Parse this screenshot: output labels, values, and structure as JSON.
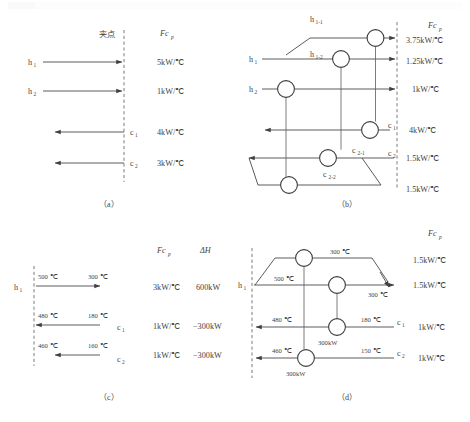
{
  "figure": {
    "captions": {
      "a": "（a）",
      "b": "（b）",
      "c": "（c）",
      "d": "（d）"
    },
    "headers": {
      "fcp": "Fc",
      "fcp_sub": "p",
      "dh": "ΔH",
      "pinch": "夹点"
    }
  },
  "panel_a": {
    "streams": [
      {
        "label": "h",
        "sub": "1",
        "fcp": "5kW/℃",
        "direction": "right"
      },
      {
        "label": "h",
        "sub": "2",
        "fcp": "1kW/℃",
        "direction": "right"
      },
      {
        "label": "c",
        "sub": "1",
        "fcp": "4kW/℃",
        "direction": "left"
      },
      {
        "label": "c",
        "sub": "2",
        "fcp": "3kW/℃",
        "direction": "left"
      }
    ]
  },
  "panel_b": {
    "branch_labels": [
      {
        "label": "h",
        "sub": "1-1"
      },
      {
        "label": "h",
        "sub": "1-2"
      },
      {
        "label": "c",
        "sub": "2-1"
      },
      {
        "label": "c",
        "sub": "2-2"
      }
    ],
    "stream_labels": [
      {
        "label": "h",
        "sub": "1"
      },
      {
        "label": "h",
        "sub": "2"
      },
      {
        "label": "c",
        "sub": "1"
      },
      {
        "label": "c",
        "sub": "2"
      }
    ],
    "fcp_values": [
      "3.75kW/℃",
      "1.25kW/℃",
      "1kW/℃",
      "4kW/℃",
      "1.5kW/℃",
      "1.5kW/℃"
    ]
  },
  "panel_c": {
    "rows": [
      {
        "label": "h",
        "sub": "1",
        "t_in": "500 ℃",
        "t_out": "300 ℃",
        "fcp": "3kW/℃",
        "dh": "600kW",
        "direction": "right"
      },
      {
        "label": "c",
        "sub": "1",
        "t_in": "480 ℃",
        "t_out": "180 ℃",
        "fcp": "1kW/℃",
        "dh": "−300kW",
        "direction": "left"
      },
      {
        "label": "c",
        "sub": "2",
        "t_in": "460 ℃",
        "t_out": "160 ℃",
        "fcp": "1kW/℃",
        "dh": "−300kW",
        "direction": "left"
      }
    ]
  },
  "panel_d": {
    "stream_labels": [
      {
        "label": "h",
        "sub": "1"
      },
      {
        "label": "c",
        "sub": "1"
      },
      {
        "label": "c",
        "sub": "2"
      }
    ],
    "temperatures": {
      "branch_top_out": "300 ℃",
      "h1_in": "500 ℃",
      "h1_out": "300 ℃",
      "c1_out": "480 ℃",
      "c1_in": "180 ℃",
      "c2_out": "460 ℃",
      "c2_in": "150 ℃"
    },
    "duties": [
      "300kW",
      "300kW"
    ],
    "fcp_values": [
      "1.5kW/℃",
      "1.5kW/℃",
      "1kW/℃",
      "1kW/℃"
    ]
  }
}
